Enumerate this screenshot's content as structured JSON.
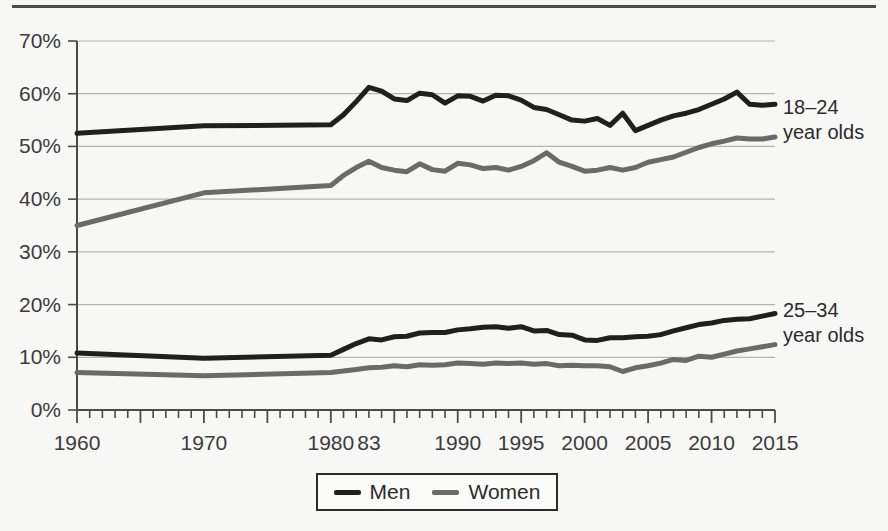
{
  "chart_data": {
    "type": "line",
    "title": "",
    "subtitle": "",
    "xlabel": "",
    "ylabel": "",
    "xlim": [
      1960,
      2015
    ],
    "ylim": [
      0,
      70
    ],
    "ytick_values": [
      0,
      10,
      20,
      30,
      40,
      50,
      60,
      70
    ],
    "ytick_labels": [
      "0%",
      "10%",
      "20%",
      "30%",
      "40%",
      "50%",
      "60%",
      "70%"
    ],
    "xtick_labels": [
      "1960",
      "1970",
      "1980",
      "83",
      "1990",
      "1995",
      "2000",
      "2005",
      "2010",
      "2015"
    ],
    "xtick_values": [
      1960,
      1970,
      1980,
      1983,
      1990,
      1995,
      2000,
      2005,
      2010,
      2015
    ],
    "grid": "horizontal",
    "legend_position": "bottom-center",
    "legend": [
      {
        "name": "Men",
        "color": "#1f1f1f"
      },
      {
        "name": "Women",
        "color": "#6a6a6a"
      }
    ],
    "group_annotations": [
      {
        "id": "g1824",
        "line1": "18–24",
        "line2": "year olds"
      },
      {
        "id": "g2534",
        "line1": "25–34",
        "line2": "year olds"
      }
    ],
    "series": [
      {
        "name": "Men 18-24",
        "group": "18–24 year olds",
        "sex": "Men",
        "color": "#1f1f1f",
        "x": [
          1960,
          1970,
          1980,
          1981,
          1982,
          1983,
          1984,
          1985,
          1986,
          1987,
          1988,
          1989,
          1990,
          1991,
          1992,
          1993,
          1994,
          1995,
          1996,
          1997,
          1998,
          1999,
          2000,
          2001,
          2002,
          2003,
          2004,
          2005,
          2006,
          2007,
          2008,
          2009,
          2010,
          2011,
          2012,
          2013,
          2014,
          2015
        ],
        "values": [
          52.5,
          53.9,
          54.1,
          56.0,
          58.5,
          61.2,
          60.5,
          59.0,
          58.7,
          60.1,
          59.8,
          58.2,
          59.6,
          59.5,
          58.6,
          59.7,
          59.6,
          58.8,
          57.4,
          57.0,
          56.0,
          55.0,
          54.8,
          55.3,
          54.0,
          56.3,
          53.0,
          54.0,
          55.0,
          55.8,
          56.3,
          57.0,
          58.0,
          59.0,
          60.3,
          58.0,
          57.8,
          58.0
        ]
      },
      {
        "name": "Women 18-24",
        "group": "18–24 year olds",
        "sex": "Women",
        "color": "#6a6a6a",
        "x": [
          1960,
          1970,
          1980,
          1981,
          1982,
          1983,
          1984,
          1985,
          1986,
          1987,
          1988,
          1989,
          1990,
          1991,
          1992,
          1993,
          1994,
          1995,
          1996,
          1997,
          1998,
          1999,
          2000,
          2001,
          2002,
          2003,
          2004,
          2005,
          2006,
          2007,
          2008,
          2009,
          2010,
          2011,
          2012,
          2013,
          2014,
          2015
        ],
        "values": [
          35.0,
          41.2,
          42.6,
          44.5,
          46.0,
          47.2,
          46.0,
          45.5,
          45.2,
          46.7,
          45.6,
          45.3,
          46.8,
          46.5,
          45.8,
          46.0,
          45.5,
          46.2,
          47.3,
          48.8,
          47.0,
          46.2,
          45.3,
          45.5,
          46.0,
          45.5,
          46.0,
          47.0,
          47.5,
          48.0,
          48.9,
          49.8,
          50.5,
          51.0,
          51.6,
          51.4,
          51.4,
          51.8
        ]
      },
      {
        "name": "Men 25-34",
        "group": "25–34 year olds",
        "sex": "Men",
        "color": "#1f1f1f",
        "x": [
          1960,
          1970,
          1980,
          1981,
          1982,
          1983,
          1984,
          1985,
          1986,
          1987,
          1988,
          1989,
          1990,
          1991,
          1992,
          1993,
          1994,
          1995,
          1996,
          1997,
          1998,
          1999,
          2000,
          2001,
          2002,
          2003,
          2004,
          2005,
          2006,
          2007,
          2008,
          2009,
          2010,
          2011,
          2012,
          2013,
          2014,
          2015
        ],
        "values": [
          10.8,
          9.8,
          10.4,
          11.5,
          12.6,
          13.5,
          13.3,
          13.9,
          14.0,
          14.6,
          14.7,
          14.7,
          15.2,
          15.4,
          15.7,
          15.8,
          15.5,
          15.8,
          15.0,
          15.1,
          14.3,
          14.2,
          13.3,
          13.2,
          13.7,
          13.7,
          13.9,
          14.0,
          14.3,
          15.0,
          15.6,
          16.2,
          16.5,
          17.0,
          17.2,
          17.3,
          17.8,
          18.3
        ]
      },
      {
        "name": "Women 25-34",
        "group": "25–34 year olds",
        "sex": "Women",
        "color": "#6a6a6a",
        "x": [
          1960,
          1970,
          1980,
          1981,
          1982,
          1983,
          1984,
          1985,
          1986,
          1987,
          1988,
          1989,
          1990,
          1991,
          1992,
          1993,
          1994,
          1995,
          1996,
          1997,
          1998,
          1999,
          2000,
          2001,
          2002,
          2003,
          2004,
          2005,
          2006,
          2007,
          2008,
          2009,
          2010,
          2011,
          2012,
          2013,
          2014,
          2015
        ],
        "values": [
          7.1,
          6.5,
          7.1,
          7.4,
          7.7,
          8.0,
          8.1,
          8.4,
          8.2,
          8.6,
          8.5,
          8.6,
          8.9,
          8.8,
          8.7,
          8.9,
          8.8,
          8.9,
          8.7,
          8.8,
          8.4,
          8.5,
          8.4,
          8.4,
          8.2,
          7.3,
          8.0,
          8.4,
          8.9,
          9.6,
          9.4,
          10.2,
          10.0,
          10.6,
          11.2,
          11.6,
          12.0,
          12.4
        ]
      }
    ]
  },
  "legend_box": {
    "men_label": "Men",
    "women_label": "Women"
  },
  "annotations": {
    "top_group": {
      "line1": "18–24",
      "line2": "year olds"
    },
    "bottom_group": {
      "line1": "25–34",
      "line2": "year olds"
    }
  },
  "colors": {
    "men": "#1f1f1f",
    "women": "#6a6a6a",
    "grid": "#b4b4b4",
    "axis": "#4a4a4a",
    "background": "#f7f7f5",
    "text": "#3b3b3b"
  }
}
